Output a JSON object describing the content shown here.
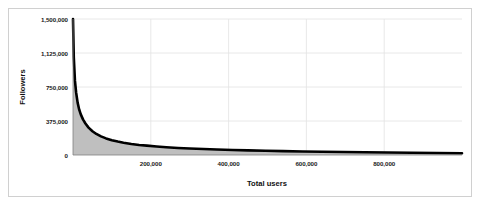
{
  "chart_data": {
    "type": "area",
    "title": "",
    "xlabel": "Total users",
    "ylabel": "Followers",
    "xlim": [
      0,
      1000000
    ],
    "ylim": [
      0,
      1500000
    ],
    "grid": true,
    "legend": null,
    "xticks": [
      {
        "value": 200000,
        "label": "200,000"
      },
      {
        "value": 400000,
        "label": "400,000"
      },
      {
        "value": 600000,
        "label": "600,000"
      },
      {
        "value": 800000,
        "label": "800,000"
      }
    ],
    "yticks": [
      {
        "value": 0,
        "label": "0"
      },
      {
        "value": 375000,
        "label": "375,000"
      },
      {
        "value": 750000,
        "label": "750,000"
      },
      {
        "value": 1125000,
        "label": "1,125,000"
      },
      {
        "value": 1500000,
        "label": "1,500,000"
      }
    ],
    "series": [
      {
        "name": "Followers",
        "line_color": "#000000",
        "fill_color": "#bfbfbf",
        "x": [
          0,
          2000,
          5000,
          8000,
          12000,
          16000,
          20000,
          26000,
          32000,
          40000,
          50000,
          60000,
          72000,
          85000,
          100000,
          115000,
          130000,
          150000,
          170000,
          190000,
          215000,
          240000,
          270000,
          300000,
          335000,
          370000,
          410000,
          450000,
          495000,
          540000,
          590000,
          640000,
          695000,
          750000,
          810000,
          870000,
          935000,
          1000000
        ],
        "values": [
          1500000,
          1080000,
          820000,
          690000,
          575000,
          500000,
          448000,
          390000,
          347000,
          302000,
          262000,
          232000,
          205000,
          183000,
          163000,
          148000,
          136000,
          122000,
          111000,
          103000,
          94000,
          86000,
          78000,
          72000,
          66000,
          61000,
          55000,
          51000,
          47000,
          43000,
          39000,
          36000,
          33000,
          30000,
          27000,
          25000,
          22000,
          20000
        ]
      }
    ]
  },
  "axes": {
    "x_title": "Total users",
    "y_title": "Followers"
  }
}
